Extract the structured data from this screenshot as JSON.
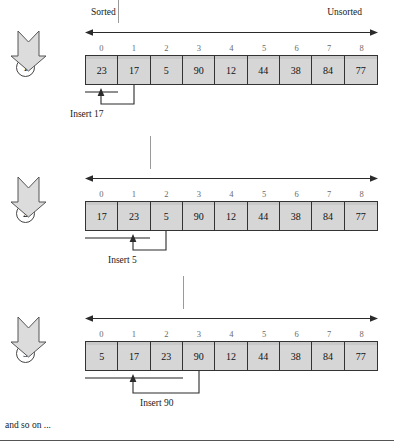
{
  "figure": {
    "header": {
      "sorted_label": "Sorted",
      "unsorted_label": "Unsorted"
    },
    "footer": {
      "and_so_on": "and so on ..."
    },
    "indices": [
      "0",
      "1",
      "2",
      "3",
      "4",
      "5",
      "6",
      "7",
      "8"
    ],
    "colors": {
      "cell_fill": "#d6d6d6",
      "cell_border": "#333333",
      "divider": "#9a9a9a",
      "arrow_fill": "#d9d9d9",
      "arrow_stroke": "#555555",
      "sorted_bar": "#8f8f8f",
      "index_text": "#6a6a6a"
    },
    "steps": [
      {
        "number": "1",
        "values": [
          "23",
          "17",
          "5",
          "90",
          "12",
          "44",
          "38",
          "84",
          "77"
        ],
        "divider_index": 1,
        "source_index": 1,
        "target_index": 0,
        "insert_label": "Insert 17"
      },
      {
        "number": "2",
        "values": [
          "17",
          "23",
          "5",
          "90",
          "12",
          "44",
          "38",
          "84",
          "77"
        ],
        "divider_index": 2,
        "source_index": 2,
        "target_index": 1,
        "insert_label": "Insert 5"
      },
      {
        "number": "3",
        "values": [
          "5",
          "17",
          "23",
          "90",
          "12",
          "44",
          "38",
          "84",
          "77"
        ],
        "divider_index": 3,
        "source_index": 3,
        "target_index": 1,
        "insert_label": "Insert 90"
      }
    ]
  }
}
